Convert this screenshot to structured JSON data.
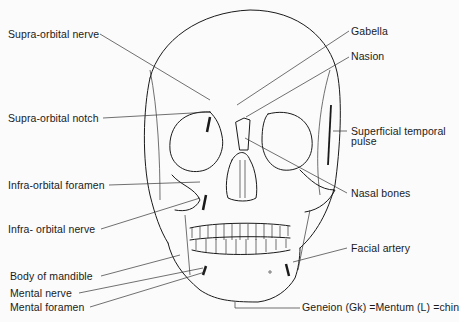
{
  "figure": {
    "labels": {
      "supra_orbital_nerve": "Supra-orbital nerve",
      "supra_orbital_notch": "Supra-orbital notch",
      "infra_orbital_foramen": "Infra-orbital foramen",
      "infra_orbital_nerve": "Infra- orbital nerve",
      "body_of_mandible": "Body of mandible",
      "mental_nerve": "Mental nerve",
      "mental_foramen": "Mental foramen",
      "gabella": "Gabella",
      "nasion": "Nasion",
      "superficial_temporal_pulse_1": "Superficial temporal",
      "superficial_temporal_pulse_2": "pulse",
      "nasal_bones": "Nasal bones",
      "facial_artery": "Facial artery",
      "geneion": "Geneion (Gk) =Mentum (L) =chin"
    }
  }
}
